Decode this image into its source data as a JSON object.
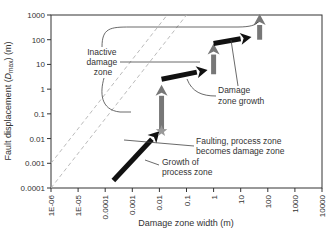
{
  "chart_data": {
    "type": "line",
    "title": "",
    "xlabel": "Damage zone width (m)",
    "ylabel": "Fault displacement (Dmax) (m)",
    "ylabel_parts": {
      "pre": "Fault displacement (",
      "var": "D",
      "sub": "max",
      "post": ") (m)"
    },
    "xscale": "log",
    "yscale": "log",
    "xlim": [
      1e-06,
      10000
    ],
    "ylim": [
      0.0001,
      1000
    ],
    "x_ticks": [
      "1E-06",
      "1E-05",
      "0.0001",
      "0.001",
      "0.01",
      "0.1",
      "1",
      "10",
      "100",
      "1000",
      "10000"
    ],
    "y_ticks": [
      "0.0001",
      "0.001",
      "0.01",
      "0.1",
      "1",
      "10",
      "100",
      "1000"
    ],
    "grid": false,
    "reference_lines": [
      {
        "style": "dashed",
        "color": "#bbbbbb",
        "description": "lower diagonal bound",
        "points": [
          [
            1e-06,
            0.0001
          ],
          [
            10000,
            10000000000
          ]
        ]
      },
      {
        "style": "dashed",
        "color": "#bbbbbb",
        "description": "upper diagonal bound",
        "points": [
          [
            1e-06,
            0.001
          ],
          [
            10000,
            100000000000
          ]
        ]
      }
    ],
    "series": [
      {
        "name": "Growth of process zone",
        "color": "#111111",
        "kind": "arrow",
        "points": [
          [
            0.0002,
            0.0002
          ],
          [
            0.01,
            0.02
          ]
        ]
      },
      {
        "name": "Damage zone growth (step 1)",
        "color": "#777777",
        "kind": "arrow",
        "points": [
          [
            0.012,
            0.02
          ],
          [
            0.012,
            1.5
          ]
        ]
      },
      {
        "name": "Inactive damage zone (step 1)",
        "color": "#111111",
        "kind": "arrow",
        "points": [
          [
            0.012,
            2.5
          ],
          [
            0.6,
            6
          ]
        ]
      },
      {
        "name": "Damage zone growth (step 2)",
        "color": "#777777",
        "kind": "arrow",
        "points": [
          [
            1,
            4
          ],
          [
            1,
            70
          ]
        ]
      },
      {
        "name": "Inactive damage zone (step 2)",
        "color": "#111111",
        "kind": "arrow",
        "points": [
          [
            1,
            70
          ],
          [
            25,
            130
          ]
        ]
      },
      {
        "name": "Damage zone growth (step 3)",
        "color": "#777777",
        "kind": "arrow",
        "points": [
          [
            50,
            100
          ],
          [
            50,
            1100
          ]
        ]
      }
    ],
    "markers": [
      {
        "name": "Faulting star",
        "x": 0.012,
        "y": 0.02,
        "color": "#999999",
        "shape": "star"
      }
    ],
    "annotations": [
      {
        "text": [
          "Inactive",
          "damage",
          "zone"
        ]
      },
      {
        "text": [
          "Damage",
          "zone growth"
        ]
      },
      {
        "text": [
          "Faulting, process zone",
          "becomes damage zone"
        ]
      },
      {
        "text": [
          "Growth of",
          "process zone"
        ]
      }
    ]
  },
  "labels": {
    "inactive": [
      "Inactive",
      "damage",
      "zone"
    ],
    "growth": [
      "Damage",
      "zone growth"
    ],
    "faulting": [
      "Faulting, process zone",
      "becomes damage zone"
    ],
    "process": [
      "Growth of",
      "process zone"
    ]
  },
  "colors": {
    "black_arrow": "#111111",
    "gray_arrow": "#777777",
    "dash": "#bdbdbd",
    "axis": "#333333"
  }
}
